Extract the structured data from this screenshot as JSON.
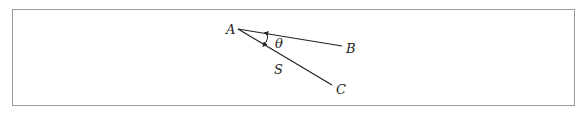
{
  "diagram": {
    "labels": {
      "vertex": "A",
      "end_b": "B",
      "end_c": "C",
      "angle": "θ",
      "segment": "S"
    },
    "colors": {
      "line": "#222222",
      "frame": "#9a9a9a"
    }
  }
}
